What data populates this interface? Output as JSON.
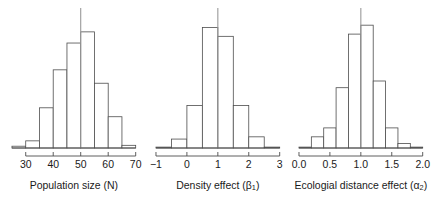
{
  "figure": {
    "background_color": "#ffffff",
    "bar_stroke_color": "#4d4d4d",
    "bar_fill_color": "#ffffff",
    "axis_color": "#4d4d4d",
    "reference_line_color": "#9a9a9a",
    "text_color": "#1a1a1a",
    "panel_count": 3
  },
  "chart_data": [
    {
      "type": "bar",
      "chart_subtype": "histogram",
      "title": "",
      "xlabel": "Population size (N)",
      "xlabel_symbol": "N",
      "ylabel": "",
      "xlim": [
        25,
        70
      ],
      "ylim": [
        0,
        30
      ],
      "grid": false,
      "legend": null,
      "xticks": [
        30,
        40,
        50,
        60,
        70
      ],
      "xticklabels": [
        "30",
        "40",
        "50",
        "60",
        "70"
      ],
      "bin_width": 5,
      "bin_edges": [
        25,
        30,
        35,
        40,
        45,
        50,
        55,
        60,
        65,
        70
      ],
      "categories": [
        "25-30",
        "30-35",
        "35-40",
        "40-45",
        "45-50",
        "50-55",
        "55-60",
        "60-65",
        "65-70"
      ],
      "values": [
        0.4,
        1.6,
        9.0,
        17.5,
        23.5,
        26.0,
        14.5,
        7.0,
        0.6
      ],
      "annotations": [
        {
          "kind": "vline",
          "x": 50,
          "color": "#9a9a9a",
          "label": "true value"
        }
      ]
    },
    {
      "type": "bar",
      "chart_subtype": "histogram",
      "title": "",
      "xlabel": "Density effect (β₁)",
      "xlabel_text": "Density effect (",
      "xlabel_symbol": "β",
      "xlabel_subscript": "1",
      "xlabel_tail": ")",
      "ylabel": "",
      "xlim": [
        -1,
        3
      ],
      "ylim": [
        0,
        30
      ],
      "grid": false,
      "legend": null,
      "xticks": [
        -1,
        0,
        1,
        2,
        3
      ],
      "xticklabels": [
        "−1",
        "0",
        "1",
        "2",
        "3"
      ],
      "bin_width": 0.5,
      "bin_edges": [
        -1.0,
        -0.5,
        0.0,
        0.5,
        1.0,
        1.5,
        2.0,
        2.5,
        3.0
      ],
      "categories": [
        "-1.0--0.5",
        "-0.5-0.0",
        "0.0-0.5",
        "0.5-1.0",
        "1.0-1.5",
        "1.5-2.0",
        "2.0-2.5",
        "2.5-3.0"
      ],
      "values": [
        0.2,
        2.0,
        9.5,
        27.0,
        25.0,
        9.5,
        2.5,
        0.2
      ],
      "annotations": [
        {
          "kind": "vline",
          "x": 1,
          "color": "#9a9a9a",
          "label": "true value"
        }
      ]
    },
    {
      "type": "bar",
      "chart_subtype": "histogram",
      "title": "",
      "xlabel": "Ecologial distance effect (α₂)",
      "xlabel_text": "Ecologial distance effect (",
      "xlabel_symbol": "α",
      "xlabel_subscript": "2",
      "xlabel_tail": ")",
      "ylabel": "",
      "xlim": [
        0.0,
        2.0
      ],
      "ylim": [
        0,
        30
      ],
      "grid": false,
      "legend": null,
      "xticks": [
        0.0,
        0.5,
        1.0,
        1.5,
        2.0
      ],
      "xticklabels": [
        "0.0",
        "0.5",
        "1.0",
        "1.5",
        "2.0"
      ],
      "bin_width": 0.2,
      "bin_edges": [
        0.0,
        0.2,
        0.4,
        0.6,
        0.8,
        1.0,
        1.2,
        1.4,
        1.6,
        1.8,
        2.0
      ],
      "categories": [
        "0.0-0.2",
        "0.2-0.4",
        "0.4-0.6",
        "0.6-0.8",
        "0.8-1.0",
        "1.0-1.2",
        "1.2-1.4",
        "1.4-1.6",
        "1.6-1.8",
        "1.8-2.0"
      ],
      "values": [
        0.2,
        2.5,
        4.5,
        13.5,
        25.5,
        27.5,
        15.0,
        4.5,
        1.0,
        0.2
      ],
      "annotations": [
        {
          "kind": "vline",
          "x": 1.0,
          "color": "#9a9a9a",
          "label": "true value"
        }
      ]
    }
  ]
}
